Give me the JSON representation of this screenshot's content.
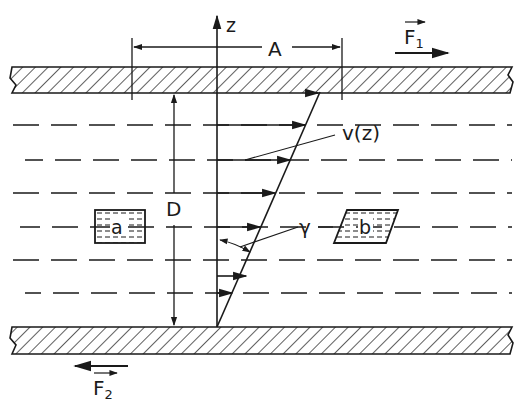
{
  "diagram": {
    "type": "shear-flow-between-parallel-plates",
    "labels": {
      "z_axis": "z",
      "area": "A",
      "distance": "D",
      "force_top": "F",
      "force_top_sub": "1",
      "force_bottom": "F",
      "force_bottom_sub": "2",
      "velocity": "v(z)",
      "shear_angle": "γ",
      "element_a": "a",
      "element_b": "b"
    },
    "colors": {
      "ink": "#1a1a1a",
      "background": "#ffffff"
    },
    "velocity_arrows": [
      {
        "y": 125,
        "x_end": 305
      },
      {
        "y": 160,
        "x_end": 290
      },
      {
        "y": 193,
        "x_end": 275
      },
      {
        "y": 227,
        "x_end": 260
      },
      {
        "y": 260,
        "x_end": 246
      },
      {
        "y": 293,
        "x_end": 232
      }
    ]
  }
}
